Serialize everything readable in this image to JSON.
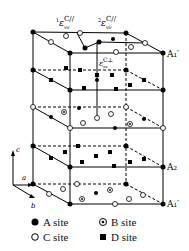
{
  "diagram": {
    "labels": {
      "eps1_par": {
        "pre": "1",
        "sym": "ε",
        "sub": "vv",
        "sup": "C//"
      },
      "eps2_par": {
        "pre": "2",
        "sym": "ε",
        "sub": "vv",
        "sup": "C//"
      },
      "eps_perp": {
        "sym": "ε",
        "sub": "vv",
        "sup": "C⊥"
      },
      "A1prime_top": "A₁′",
      "A2": "A₂",
      "A1prime_bottom": "A₁′",
      "axis_c": "c",
      "axis_a": "a",
      "axis_b": "b"
    },
    "legend": [
      {
        "symbol": "filled-circle",
        "label": "A site"
      },
      {
        "symbol": "dotted-circle",
        "label": "B site"
      },
      {
        "symbol": "open-circle",
        "label": "C site"
      },
      {
        "symbol": "filled-square",
        "label": "D site"
      }
    ]
  }
}
